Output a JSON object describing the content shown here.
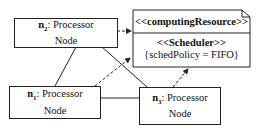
{
  "nodes": {
    "n2": {
      "name": "n",
      "sub": "2",
      "label": ": Processor",
      "line2": "Node"
    },
    "n1": {
      "name": "n",
      "sub": "1",
      "label": ": Processor",
      "line2": "Node"
    },
    "n3": {
      "name": "n",
      "sub": "3",
      "label": ": Processor",
      "line2": "Node"
    }
  },
  "resource": {
    "header": "<<computingResource>>",
    "stereotype": "<<Scheduler>>",
    "property": "{schedPolicy = FIFO}"
  },
  "colors": {
    "line": "#222222",
    "background": "#ffffff"
  }
}
